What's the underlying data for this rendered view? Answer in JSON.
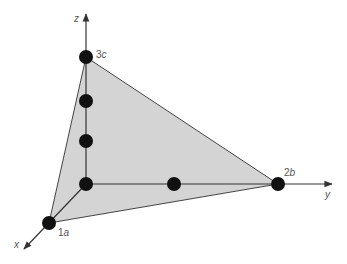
{
  "diagram": {
    "type": "3d-plane-intercepts",
    "axes": {
      "x": "x",
      "y": "y",
      "z": "z"
    },
    "intercepts": {
      "x": {
        "coef": "1",
        "var": "a"
      },
      "y": {
        "coef": "2",
        "var": "b"
      },
      "z": {
        "coef": "3",
        "var": "c"
      }
    },
    "colors": {
      "plane_fill": "#d4d4d4",
      "axis": "#333333",
      "dot": "#111111",
      "label": "#555555"
    }
  }
}
